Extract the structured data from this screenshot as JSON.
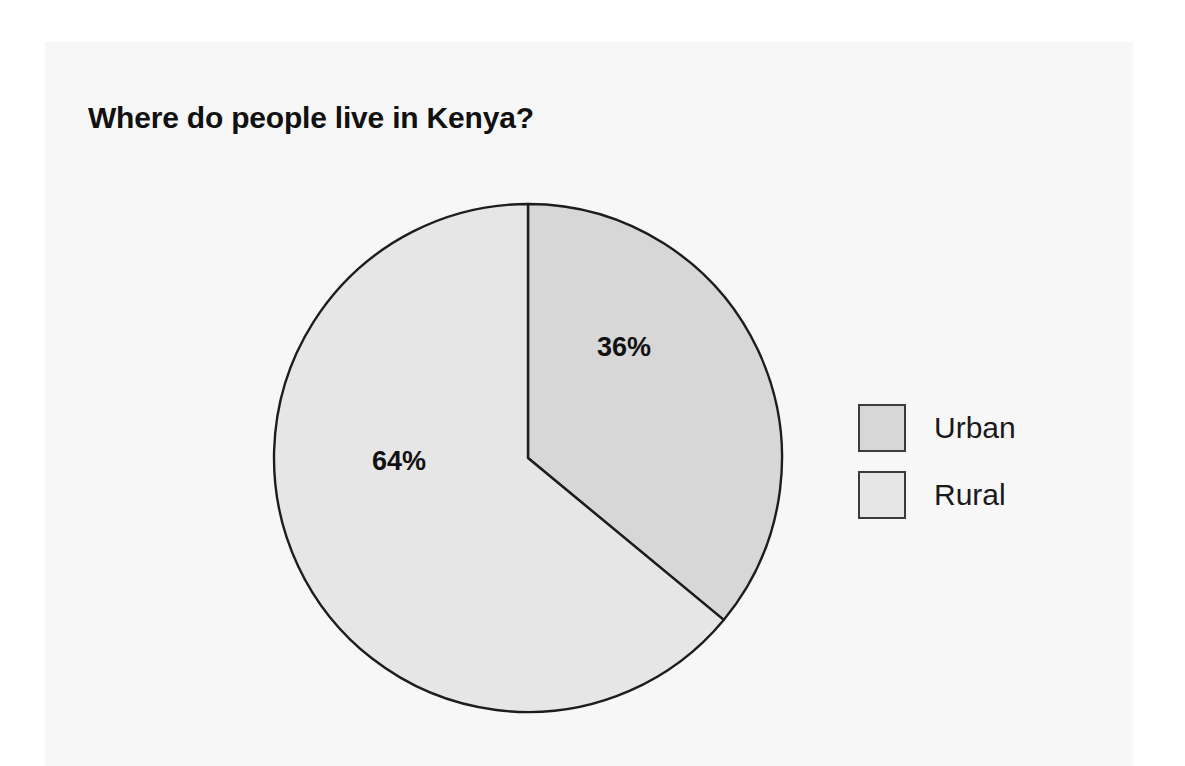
{
  "chart_data": {
    "type": "pie",
    "title": "Where do people live in Kenya?",
    "categories": [
      "Urban",
      "Rural"
    ],
    "values": [
      36,
      64
    ],
    "value_unit": "%",
    "data_labels": [
      "36%",
      "64%"
    ],
    "legend_position": "right",
    "start_angle_deg": 0,
    "direction": "clockwise",
    "slice_colors": [
      "#d7d7d7",
      "#e6e6e6"
    ],
    "slice_border_color": "#1d1d1d",
    "xlabel": "",
    "ylabel": "",
    "grid": false,
    "series": [
      {
        "name": "Share of population",
        "points": [
          {
            "label": "Urban",
            "value": 36,
            "display": "36%",
            "color": "#d7d7d7",
            "angle_deg": 129.6
          },
          {
            "label": "Rural",
            "value": 64,
            "display": "64%",
            "color": "#e6e6e6",
            "angle_deg": 230.4
          }
        ]
      }
    ]
  },
  "title": {
    "text": "Where do people live in Kenya?"
  },
  "labels": {
    "urban_pct": "36%",
    "rural_pct": "64%"
  },
  "legend": {
    "items": [
      {
        "label": "Urban",
        "swatch_color": "#d7d7d7"
      },
      {
        "label": "Rural",
        "swatch_color": "#e6e6e6"
      }
    ]
  },
  "colors": {
    "page_background": "#ffffff",
    "panel_background": "#f7f7f7",
    "urban_fill": "#d7d7d7",
    "rural_fill": "#e6e6e6",
    "outline": "#1d1d1d",
    "text": "#111111"
  }
}
